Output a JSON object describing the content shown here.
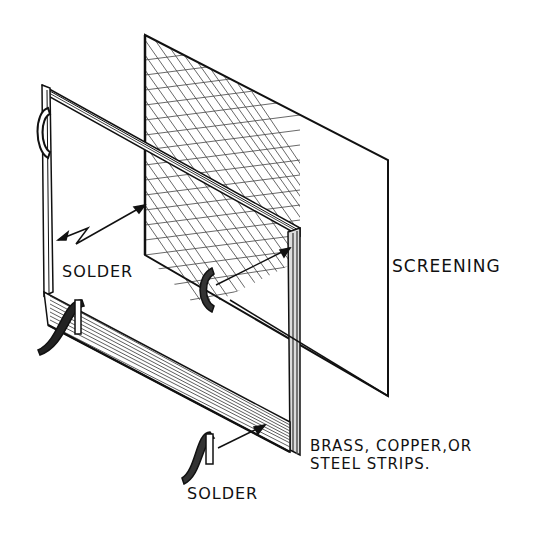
{
  "diagram": {
    "type": "exploded-assembly-illustration",
    "labels": {
      "screening": "SCREENING",
      "solder_left": "SOLDER",
      "solder_bottom": "SOLDER",
      "strips_line1": "BRASS, COPPER,OR",
      "strips_line2": "STEEL STRIPS."
    },
    "parts": [
      {
        "name": "screening",
        "description": "wire mesh screening sheet"
      },
      {
        "name": "frame",
        "description": "rectangular frame of metal strips"
      },
      {
        "name": "solder",
        "description": "solder pieces joining screen to frame"
      }
    ],
    "colors": {
      "ink": "#111111",
      "paper": "#ffffff"
    }
  }
}
